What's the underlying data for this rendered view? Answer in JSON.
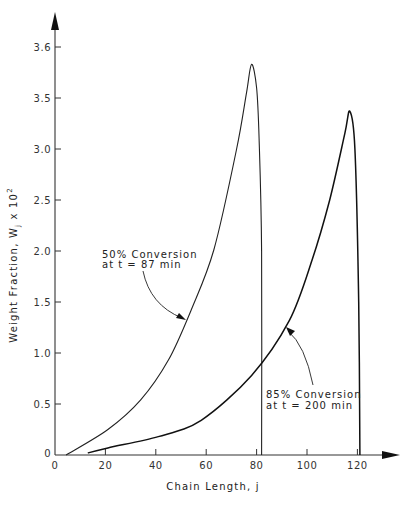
{
  "chart_data": {
    "type": "line",
    "title": "",
    "xlabel": "Chain Length, j",
    "ylabel": "Weight Fraction, Wj x 10²",
    "ylabel_parts": {
      "main": "Weight Fraction, W",
      "sub": "j",
      "suffix": " x 10",
      "sup": "2"
    },
    "xlim": [
      0,
      135
    ],
    "ylim": [
      0,
      4.1
    ],
    "grid": false,
    "legend": "none (inline annotations with arrows)",
    "x_ticks": [
      0,
      20,
      40,
      60,
      80,
      100,
      120
    ],
    "x_tick_labels": [
      "0",
      "20",
      "40",
      "60",
      "80",
      "100",
      "120"
    ],
    "y_ticks": [
      0,
      0.5,
      1.0,
      1.5,
      2.0,
      2.5,
      3.0,
      3.5,
      4.0
    ],
    "y_tick_labels": [
      "0",
      "0.5",
      "1.0",
      "1.5",
      "2.0",
      "2.5",
      "3.0",
      "3.5",
      "3.6"
    ],
    "series": [
      {
        "name": "50% Conversion at t = 87 min",
        "x": [
          4.4,
          21,
          34,
          45,
          54,
          63,
          72,
          76,
          78,
          80,
          81,
          82,
          82
        ],
        "values": [
          0,
          0.25,
          0.54,
          0.93,
          1.42,
          2.01,
          2.99,
          3.55,
          3.83,
          3.6,
          3.1,
          2.0,
          0
        ]
      },
      {
        "name": "85% Conversion at t = 200 min",
        "x": [
          13,
          21,
          41,
          58,
          78,
          93,
          102,
          109,
          115,
          117,
          119,
          120.5,
          121
        ],
        "values": [
          0.02,
          0.07,
          0.18,
          0.34,
          0.78,
          1.32,
          1.91,
          2.5,
          3.15,
          3.37,
          3.0,
          1.5,
          0
        ]
      }
    ],
    "annotations": [
      {
        "line1": "50% Conversion",
        "line2": "at t = 87 min",
        "points_to": "50% curve near j≈51, W≈1.34"
      },
      {
        "line1": "85% Conversion",
        "line2": "at t = 200 min",
        "points_to": "85% curve near j≈93, W≈1.25"
      }
    ]
  },
  "labels": {
    "x_axis_title": "Chain Length, j",
    "y_axis_main": "Weight Fraction,  W",
    "y_axis_sub": "j",
    "y_axis_suffix": " x 10",
    "y_axis_sup": "2",
    "annot1_line1": "50% Conversion",
    "annot1_line2": "at t = 87 min",
    "annot2_line1": "85% Conversion",
    "annot2_line2": "at t = 200 min",
    "origin_y": "0"
  }
}
